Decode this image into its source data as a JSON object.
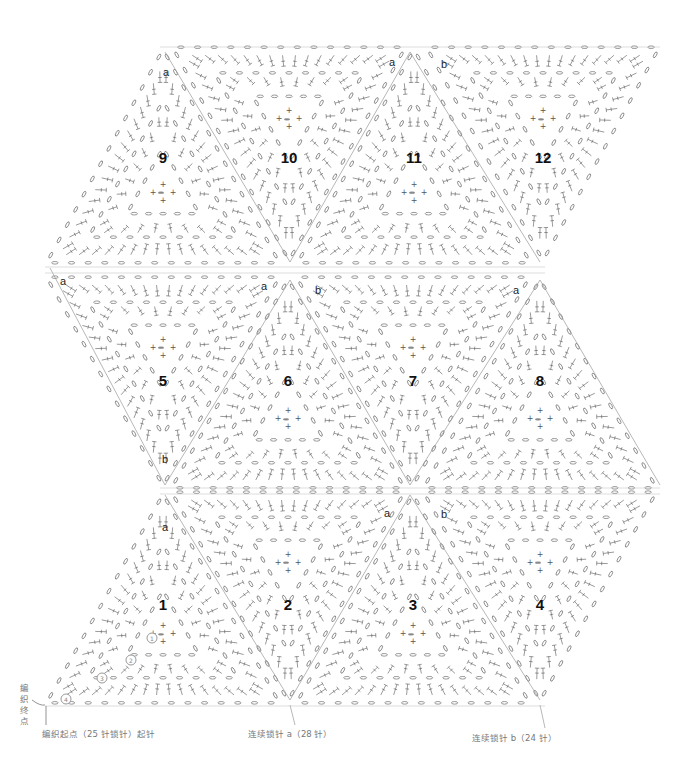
{
  "diagram": {
    "type": "crochet-motif-chart",
    "motifs": [
      {
        "num": "1",
        "row": 1,
        "orientation": "up",
        "x": 163,
        "y": 604
      },
      {
        "num": "2",
        "row": 1,
        "orientation": "down",
        "x": 288,
        "y": 604
      },
      {
        "num": "3",
        "row": 1,
        "orientation": "up",
        "x": 413,
        "y": 604
      },
      {
        "num": "4",
        "row": 1,
        "orientation": "down",
        "x": 540,
        "y": 604
      },
      {
        "num": "5",
        "row": 2,
        "orientation": "down",
        "x": 163,
        "y": 380
      },
      {
        "num": "6",
        "row": 2,
        "orientation": "up",
        "x": 288,
        "y": 380
      },
      {
        "num": "7",
        "row": 2,
        "orientation": "down",
        "x": 413,
        "y": 380
      },
      {
        "num": "8",
        "row": 2,
        "orientation": "up",
        "x": 540,
        "y": 380
      },
      {
        "num": "9",
        "row": 3,
        "orientation": "up",
        "x": 163,
        "y": 157
      },
      {
        "num": "10",
        "row": 3,
        "orientation": "down",
        "x": 289,
        "y": 157
      },
      {
        "num": "11",
        "row": 3,
        "orientation": "up",
        "x": 414,
        "y": 157
      },
      {
        "num": "12",
        "row": 3,
        "orientation": "down",
        "x": 543,
        "y": 157
      }
    ],
    "join_labels": [
      {
        "text": "a",
        "x": 166,
        "y": 72
      },
      {
        "text": "a",
        "x": 392,
        "y": 62
      },
      {
        "text": "b",
        "x": 444,
        "y": 64
      },
      {
        "text": "a",
        "x": 63,
        "y": 281
      },
      {
        "text": "a",
        "x": 264,
        "y": 286
      },
      {
        "text": "b",
        "x": 318,
        "y": 290
      },
      {
        "text": "a",
        "x": 516,
        "y": 290
      },
      {
        "text": "b",
        "x": 165,
        "y": 459
      },
      {
        "text": "a",
        "x": 165,
        "y": 527
      },
      {
        "text": "a",
        "x": 387,
        "y": 513
      },
      {
        "text": "b",
        "x": 444,
        "y": 514
      }
    ],
    "round_marks": [
      {
        "text": "1",
        "x": 152,
        "y": 638
      },
      {
        "text": "2",
        "x": 131,
        "y": 660
      },
      {
        "text": "3",
        "x": 102,
        "y": 678
      },
      {
        "text": "4",
        "x": 66,
        "y": 699
      }
    ],
    "captions": {
      "start_point": "编织起点（25 针锁针）起针",
      "end_point": "编织终点",
      "chain_a": "连续锁针 a（28 针）",
      "chain_b": "连续锁针 b（24 针）"
    }
  }
}
